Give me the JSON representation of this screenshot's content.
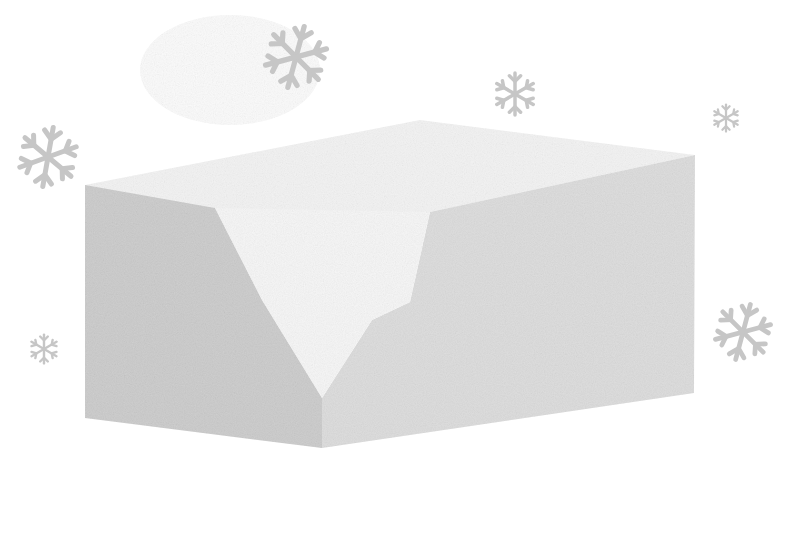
{
  "scene": {
    "title": "",
    "background_color": "#ffffff",
    "block": {
      "front_left_face_color": "#cbcbcb",
      "front_right_face_color": "#dcdcdc",
      "top_face_color": "#f1f1f1",
      "notch_face_color": "#f7f7f7"
    },
    "snowflake_color": "#c6c6c6",
    "snowflakes": [
      {
        "id": "top-center",
        "x": 296,
        "y": 57,
        "size": 64,
        "rotation": 15
      },
      {
        "id": "left-upper",
        "x": 48,
        "y": 157,
        "size": 62,
        "rotation": 10
      },
      {
        "id": "upper-right-mid",
        "x": 515,
        "y": 94,
        "size": 44,
        "rotation": 0
      },
      {
        "id": "far-right-small",
        "x": 726,
        "y": 118,
        "size": 28,
        "rotation": 0
      },
      {
        "id": "right-lower",
        "x": 743,
        "y": 332,
        "size": 58,
        "rotation": 15
      },
      {
        "id": "left-lower-small",
        "x": 44,
        "y": 349,
        "size": 30,
        "rotation": 0
      }
    ]
  }
}
